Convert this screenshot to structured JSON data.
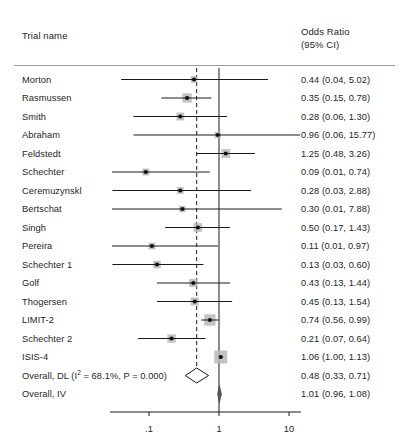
{
  "header": {
    "trial_column_label": "Trial name",
    "or_column_label_line1": "Odds Ratio",
    "or_column_label_line2": "(95% CI)"
  },
  "axis": {
    "tick_labels": [
      ".1",
      "1",
      "10"
    ],
    "tick_values": [
      0.1,
      1,
      10
    ],
    "scale": "log10",
    "null_line_value": 1,
    "pooled_reference_line_value": 0.48
  },
  "colors": {
    "text": "#262626",
    "line": "#1a1a1a",
    "marker": "#111111",
    "box_fill": "#b8b8b8",
    "rule": "#9a9a9a",
    "diamond_outline": "#1a1a1a",
    "diamond_fill_open": "#ffffff",
    "diamond_fill_solid": "#55555a"
  },
  "chart_data": {
    "type": "forest",
    "title": "",
    "xlabel": "",
    "ylabel": "",
    "effect_measure": "Odds Ratio",
    "ci_level": "95% CI",
    "xscale": "log",
    "xlim": [
      0.03,
      18
    ],
    "grid": false,
    "null_line": 1,
    "rows": [
      {
        "name": "Morton",
        "est": 0.44,
        "lo": 0.04,
        "hi": 5.02,
        "label": "0.44 (0.04, 5.02)",
        "weight": 0.9,
        "type": "study"
      },
      {
        "name": "Rasmussen",
        "est": 0.35,
        "lo": 0.15,
        "hi": 0.78,
        "label": "0.35 (0.15, 0.78)",
        "weight": 4.2,
        "type": "study"
      },
      {
        "name": "Smith",
        "est": 0.28,
        "lo": 0.06,
        "hi": 1.3,
        "label": "0.28 (0.06, 1.30)",
        "weight": 2.2,
        "type": "study"
      },
      {
        "name": "Abraham",
        "est": 0.96,
        "lo": 0.06,
        "hi": 15.77,
        "label": "0.96 (0.06, 15.77)",
        "weight": 0.8,
        "type": "study"
      },
      {
        "name": "Feldstedt",
        "est": 1.25,
        "lo": 0.48,
        "hi": 3.26,
        "label": "1.25 (0.48, 3.26)",
        "weight": 3.4,
        "type": "study"
      },
      {
        "name": "Schechter",
        "est": 0.09,
        "lo": 0.01,
        "hi": 0.74,
        "label": "0.09 (0.01, 0.74)",
        "weight": 1.3,
        "type": "study"
      },
      {
        "name": "Ceremuzynskl",
        "est": 0.28,
        "lo": 0.03,
        "hi": 2.88,
        "label": "0.28 (0.03, 2.88)",
        "weight": 1.1,
        "type": "study"
      },
      {
        "name": "Bertschat",
        "est": 0.3,
        "lo": 0.01,
        "hi": 7.88,
        "label": "0.30 (0.01, 7.88)",
        "weight": 0.8,
        "type": "study"
      },
      {
        "name": "Singh",
        "est": 0.5,
        "lo": 0.17,
        "hi": 1.43,
        "label": "0.50 (0.17, 1.43)",
        "weight": 3.2,
        "type": "study"
      },
      {
        "name": "Pereira",
        "est": 0.11,
        "lo": 0.01,
        "hi": 0.97,
        "label": "0.11 (0.01, 0.97)",
        "weight": 1.2,
        "type": "study"
      },
      {
        "name": "Schechter 1",
        "est": 0.13,
        "lo": 0.03,
        "hi": 0.6,
        "label": "0.13 (0.03, 0.60)",
        "weight": 2.0,
        "type": "study"
      },
      {
        "name": "Golf",
        "est": 0.43,
        "lo": 0.13,
        "hi": 1.44,
        "label": "0.43 (0.13, 1.44)",
        "weight": 2.6,
        "type": "study"
      },
      {
        "name": "Thogersen",
        "est": 0.45,
        "lo": 0.13,
        "hi": 1.54,
        "label": "0.45 (0.13, 1.54)",
        "weight": 2.5,
        "type": "study"
      },
      {
        "name": "LIMIT-2",
        "est": 0.74,
        "lo": 0.56,
        "hi": 0.99,
        "label": "0.74 (0.56, 0.99)",
        "weight": 8.0,
        "type": "study"
      },
      {
        "name": "Schechter 2",
        "est": 0.21,
        "lo": 0.07,
        "hi": 0.64,
        "label": "0.21 (0.07, 0.64)",
        "weight": 2.8,
        "type": "study"
      },
      {
        "name": "ISIS-4",
        "est": 1.06,
        "lo": 1.0,
        "hi": 1.13,
        "label": "1.06 (1.00, 1.13)",
        "weight": 12.0,
        "type": "study"
      },
      {
        "name": "Overall, DL (I2 = 68.1%, P = 0.000)",
        "name_prefix": "Overall, DL (I",
        "name_sup": "2",
        "name_suffix": " = 68.1%, P = 0.000)",
        "est": 0.48,
        "lo": 0.33,
        "hi": 0.71,
        "label": "0.48 (0.33, 0.71)",
        "type": "summary-open"
      },
      {
        "name": "Overall, IV",
        "est": 1.01,
        "lo": 0.96,
        "hi": 1.08,
        "label": "1.01 (0.96, 1.08)",
        "type": "summary-solid"
      }
    ],
    "heterogeneity": {
      "i_squared_pct": 68.1,
      "p_value": "0.000"
    }
  }
}
